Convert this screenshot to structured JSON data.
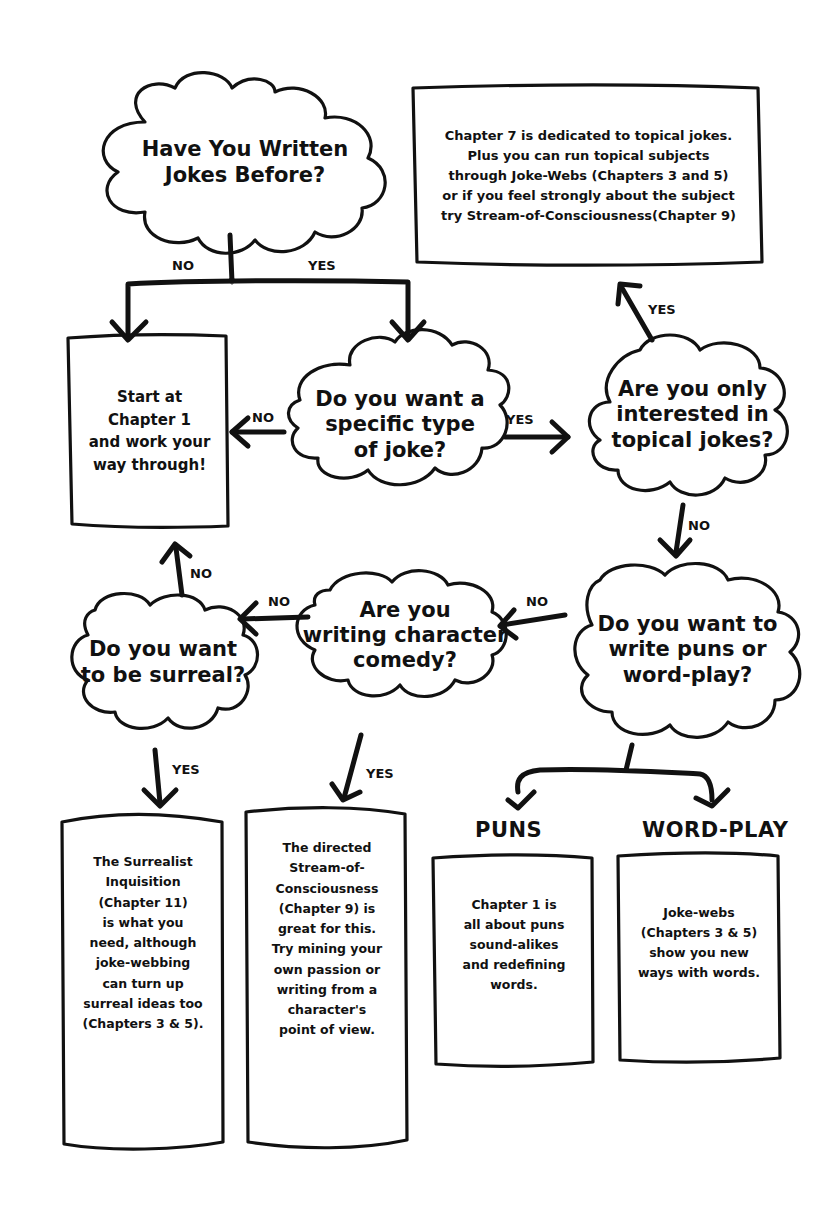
{
  "diagram": {
    "type": "flowchart",
    "theme": {
      "stroke": "#111111",
      "background": "#ffffff"
    },
    "questions": {
      "q1": {
        "lines": [
          "Have You Written",
          "Jokes Before?"
        ]
      },
      "q2": {
        "lines": [
          "Do you want a",
          "specific type",
          "of joke?"
        ]
      },
      "q3": {
        "lines": [
          "Are you only",
          "interested in",
          "topical jokes?"
        ]
      },
      "q4": {
        "lines": [
          "Do you want to",
          "write puns or",
          "word-play?"
        ]
      },
      "q5": {
        "lines": [
          "Are you",
          "writing character",
          "comedy?"
        ]
      },
      "q6": {
        "lines": [
          "Do you want",
          "to be surreal?"
        ]
      }
    },
    "outcomes": {
      "start": {
        "lines": [
          "Start at",
          "Chapter 1",
          "and work your",
          "way through!"
        ]
      },
      "topical": {
        "lines": [
          "Chapter 7 is dedicated to topical jokes.",
          "Plus you can run topical subjects",
          "through Joke-Webs (Chapters 3 and 5)",
          "or if you feel strongly about the subject",
          "try Stream-of-Consciousness(Chapter 9)"
        ]
      },
      "surreal": {
        "lines": [
          "The Surrealist",
          "Inquisition",
          "(Chapter 11)",
          "is what you",
          "need, although",
          "joke-webbing",
          "can turn up",
          "surreal ideas too",
          "(Chapters 3 & 5)."
        ]
      },
      "character": {
        "lines": [
          "The directed",
          "Stream-of-",
          "Consciousness",
          "(Chapter 9) is",
          "great for this.",
          "Try mining your",
          "own passion or",
          "writing from a",
          "character's",
          "point of view."
        ]
      },
      "puns": {
        "heading": "PUNS",
        "lines": [
          "Chapter 1 is",
          "all about puns",
          "sound-alikes",
          "and redefining",
          "words."
        ]
      },
      "wordplay": {
        "heading": "WORD-PLAY",
        "lines": [
          "Joke-webs",
          "(Chapters 3 & 5)",
          "show you new",
          "ways with words."
        ]
      }
    },
    "edge_labels": {
      "q1_no": "NO",
      "q1_yes": "YES",
      "q2_no": "NO",
      "q2_yes": "YES",
      "q3_yes": "YES",
      "q3_no": "NO",
      "q4_no": "NO",
      "q5_no": "NO",
      "q5_yes": "YES",
      "q6_no": "NO",
      "q6_yes": "YES"
    },
    "edges": [
      {
        "from": "q1",
        "to": "start",
        "label": "NO"
      },
      {
        "from": "q1",
        "to": "q2",
        "label": "YES"
      },
      {
        "from": "q2",
        "to": "start",
        "label": "NO"
      },
      {
        "from": "q2",
        "to": "q3",
        "label": "YES"
      },
      {
        "from": "q3",
        "to": "topical",
        "label": "YES"
      },
      {
        "from": "q3",
        "to": "q4",
        "label": "NO"
      },
      {
        "from": "q4",
        "to": "q5",
        "label": "NO"
      },
      {
        "from": "q4",
        "to": "puns",
        "label": ""
      },
      {
        "from": "q4",
        "to": "wordplay",
        "label": ""
      },
      {
        "from": "q5",
        "to": "q6",
        "label": "NO"
      },
      {
        "from": "q5",
        "to": "character",
        "label": "YES"
      },
      {
        "from": "q6",
        "to": "start",
        "label": "NO"
      },
      {
        "from": "q6",
        "to": "surreal",
        "label": "YES"
      }
    ]
  }
}
